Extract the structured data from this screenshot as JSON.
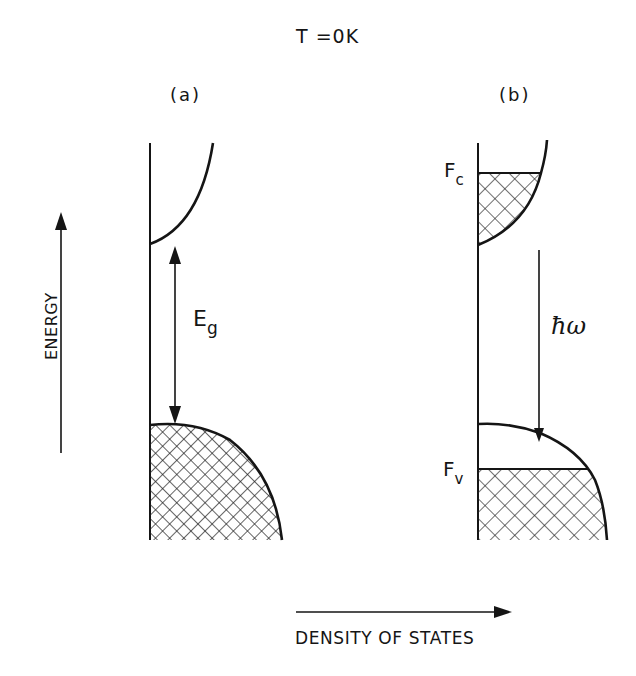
{
  "figure": {
    "title": "T =0K",
    "panels": [
      {
        "id": "a",
        "label": "(a)",
        "annotations": {
          "gap_label": "E",
          "gap_subscript": "g"
        },
        "description": "Intrinsic semiconductor at 0 K: empty conduction band, completely filled valence band, band gap Eg."
      },
      {
        "id": "b",
        "label": "(b)",
        "annotations": {
          "conduction_quasi_fermi": "F",
          "conduction_quasi_fermi_subscript": "c",
          "valence_quasi_fermi": "F",
          "valence_quasi_fermi_subscript": "v",
          "photon_energy": "ħω"
        },
        "description": "Inverted semiconductor: conduction band filled up to Fc, valence band filled only up to Fv; downward arrow indicates emission of photon energy ħω."
      }
    ],
    "axes": {
      "y_label": "ENERGY",
      "x_label": "DENSITY OF STATES"
    }
  },
  "colors": {
    "background": "#ffffff",
    "ink": "#151515"
  }
}
